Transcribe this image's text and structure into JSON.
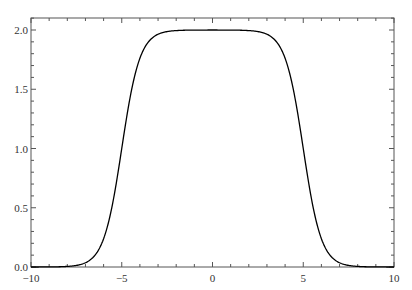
{
  "chart_data": {
    "type": "line",
    "title": "",
    "xlabel": "",
    "ylabel": "",
    "xlim": [
      -10,
      10
    ],
    "ylim": [
      0,
      2.1
    ],
    "grid": false,
    "legend": null,
    "function_estimate": "tanh(x+5) - tanh(x-5)",
    "x_ticks": [
      -10,
      -5,
      0,
      5,
      10
    ],
    "x_tick_labels": [
      "−10",
      "−5",
      "0",
      "5",
      "10"
    ],
    "y_ticks": [
      0.0,
      0.5,
      1.0,
      1.5,
      2.0
    ],
    "y_tick_labels": [
      "0.0",
      "0.5",
      "1.0",
      "1.5",
      "2.0"
    ],
    "series": [
      {
        "name": "f(x)",
        "color": "#000000",
        "x": [
          -10,
          -9,
          -8,
          -7.5,
          -7,
          -6.5,
          -6,
          -5.5,
          -5,
          -4.5,
          -4,
          -3.5,
          -3,
          -2,
          -1,
          0,
          1,
          2,
          3,
          3.5,
          4,
          4.5,
          5,
          5.5,
          6,
          6.5,
          7,
          7.5,
          8,
          9,
          10
        ],
        "values": [
          0.0,
          0.005,
          0.005,
          0.013,
          0.036,
          0.095,
          0.238,
          0.538,
          1.0,
          1.462,
          1.762,
          1.905,
          1.964,
          1.995,
          1.999,
          2.0,
          1.999,
          1.995,
          1.964,
          1.905,
          1.762,
          1.462,
          1.0,
          0.538,
          0.238,
          0.095,
          0.036,
          0.013,
          0.005,
          0.005,
          0.0
        ]
      }
    ]
  },
  "colors": {
    "frame": "#555555",
    "curve": "#000000",
    "label": "#333333"
  }
}
